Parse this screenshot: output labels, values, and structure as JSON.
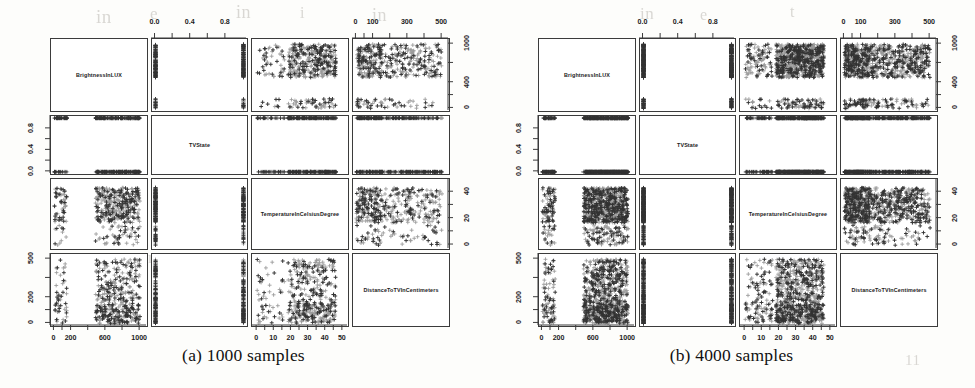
{
  "figure": {
    "type": "scatterplot-matrix-pair",
    "background_color": "#fdfdfb",
    "point_color_dark": "#333333",
    "point_color_light": "#9a9a9a",
    "axis_color": "#3b3b3b"
  },
  "variables": [
    "BrightnessInLUX",
    "TVState",
    "TemperatureInCelsiusDegree",
    "DistanceToTVInCentimeters"
  ],
  "subfigures": [
    {
      "id": "a",
      "caption": "(a) 1000 samples",
      "sample_count": 1000,
      "panel_labels": [
        "BrightnessInLUX",
        "TVState",
        "TemperatureInCelsiusDegree",
        "DistanceToTVInCentimeters"
      ]
    },
    {
      "id": "b",
      "caption": "(b) 4000 samples",
      "sample_count": 4000,
      "panel_labels": [
        "BrightnessInLUX",
        "TVState",
        "TemperatureInCelsiusDegree",
        "DistanceToTVInCentimeters"
      ]
    }
  ],
  "axes": {
    "top_tvstate": {
      "label": "TVState",
      "ticks": [
        "0.0",
        "0.4",
        "0.8"
      ],
      "values": [
        0.0,
        0.4,
        0.8
      ],
      "range": [
        -0.04,
        1.04
      ]
    },
    "top_distance": {
      "label": "DistanceToTVInCentimeters",
      "ticks": [
        "0",
        "100",
        "300",
        "500"
      ],
      "values": [
        0,
        100,
        300,
        500
      ],
      "range": [
        -20,
        540
      ]
    },
    "right_brightness": {
      "label": "BrightnessInLUX",
      "ticks": [
        "0",
        "400",
        "1000"
      ],
      "values": [
        0,
        400,
        1000
      ],
      "range": [
        -40,
        1080
      ]
    },
    "right_temperature": {
      "label": "TemperatureInCelsiusDegree",
      "ticks": [
        "0",
        "20",
        "40"
      ],
      "values": [
        0,
        20,
        40
      ],
      "range": [
        -3,
        50
      ]
    },
    "left_tvstate": {
      "label": "TVState",
      "ticks": [
        "0.0",
        "0.4",
        "0.8"
      ],
      "values": [
        0.0,
        0.4,
        0.8
      ],
      "range": [
        -0.04,
        1.04
      ]
    },
    "left_distance": {
      "label": "DistanceToTVInCentimeters",
      "ticks": [
        "0",
        "200",
        "500"
      ],
      "values": [
        0,
        200,
        500
      ],
      "range": [
        -20,
        540
      ]
    },
    "bottom_brightness": {
      "label": "BrightnessInLUX",
      "ticks": [
        "0",
        "200",
        "600",
        "1000"
      ],
      "values": [
        0,
        200,
        600,
        1000
      ],
      "range": [
        -40,
        1080
      ]
    },
    "bottom_temperature": {
      "label": "TemperatureInCelsiusDegree",
      "ticks": [
        "0",
        "10",
        "20",
        "30",
        "40",
        "50"
      ],
      "values": [
        0,
        10,
        20,
        30,
        40,
        50
      ],
      "range": [
        -3,
        53
      ]
    }
  },
  "chart_data": {
    "type": "scatter",
    "title": "",
    "subtitle": "",
    "layout": "scatterplot matrix (pairs plot), 4x4, two panels",
    "grid": false,
    "legend": "none",
    "marker": "plus",
    "variables": [
      {
        "name": "BrightnessInLUX",
        "axis_range": [
          0,
          1000
        ],
        "ticks": [
          0,
          200,
          400,
          600,
          1000
        ],
        "unit": "LUX"
      },
      {
        "name": "TVState",
        "axis_range": [
          0,
          1
        ],
        "ticks": [
          0.0,
          0.4,
          0.8
        ],
        "unit": "binary"
      },
      {
        "name": "TemperatureInCelsiusDegree",
        "axis_range": [
          0,
          50
        ],
        "ticks": [
          0,
          10,
          20,
          30,
          40,
          50
        ],
        "unit": "degC"
      },
      {
        "name": "DistanceToTVInCentimeters",
        "axis_range": [
          0,
          500
        ],
        "ticks": [
          0,
          100,
          200,
          300,
          500
        ],
        "unit": "cm"
      }
    ],
    "panels": [
      {
        "row": 1,
        "col": 1,
        "kind": "diagonal",
        "label": "BrightnessInLUX"
      },
      {
        "row": 1,
        "col": 2,
        "kind": "scatter",
        "x": "TVState",
        "y": "BrightnessInLUX",
        "pattern": "two vertical bands at x=0 and x=1"
      },
      {
        "row": 1,
        "col": 3,
        "kind": "scatter",
        "x": "TemperatureInCelsiusDegree",
        "y": "BrightnessInLUX",
        "pattern": "dense cloud at y in 500-1000 across all x; sparse band near y=0"
      },
      {
        "row": 1,
        "col": 4,
        "kind": "scatter",
        "x": "DistanceToTVInCentimeters",
        "y": "BrightnessInLUX",
        "pattern": "dense cloud at y in 500-1000 across all x; sparse band near y=0"
      },
      {
        "row": 2,
        "col": 1,
        "kind": "scatter",
        "x": "BrightnessInLUX",
        "y": "TVState",
        "pattern": "points only on y=0 and y=1 rows"
      },
      {
        "row": 2,
        "col": 2,
        "kind": "diagonal",
        "label": "TVState"
      },
      {
        "row": 2,
        "col": 3,
        "kind": "scatter",
        "x": "TemperatureInCelsiusDegree",
        "y": "TVState",
        "pattern": "points only on y=0 and y=1 rows"
      },
      {
        "row": 2,
        "col": 4,
        "kind": "scatter",
        "x": "DistanceToTVInCentimeters",
        "y": "TVState",
        "pattern": "points only on y=0 and y=1 rows"
      },
      {
        "row": 3,
        "col": 1,
        "kind": "scatter",
        "x": "BrightnessInLUX",
        "y": "TemperatureInCelsiusDegree",
        "pattern": "sparse cluster at x<150; dense cloud at x>500"
      },
      {
        "row": 3,
        "col": 2,
        "kind": "scatter",
        "x": "TVState",
        "y": "TemperatureInCelsiusDegree",
        "pattern": "two vertical bands at x=0 and x=1"
      },
      {
        "row": 3,
        "col": 3,
        "kind": "diagonal",
        "label": "TemperatureInCelsiusDegree"
      },
      {
        "row": 3,
        "col": 4,
        "kind": "scatter",
        "x": "DistanceToTVInCentimeters",
        "y": "TemperatureInCelsiusDegree",
        "pattern": "broad cloud, denser at y in 20-45"
      },
      {
        "row": 4,
        "col": 1,
        "kind": "scatter",
        "x": "BrightnessInLUX",
        "y": "DistanceToTVInCentimeters",
        "pattern": "sparse cluster at x<150; dense cloud at x>500"
      },
      {
        "row": 4,
        "col": 2,
        "kind": "scatter",
        "x": "TVState",
        "y": "DistanceToTVInCentimeters",
        "pattern": "two vertical bands at x=0 and x=1"
      },
      {
        "row": 4,
        "col": 3,
        "kind": "scatter",
        "x": "TemperatureInCelsiusDegree",
        "y": "DistanceToTVInCentimeters",
        "pattern": "broad cloud, denser at x in 25-45"
      },
      {
        "row": 4,
        "col": 4,
        "kind": "diagonal",
        "label": "DistanceToTVInCentimeters"
      }
    ]
  },
  "ghost_text": [
    {
      "t": "in",
      "x": 96,
      "y": 6,
      "size": 19
    },
    {
      "t": "e",
      "x": 150,
      "y": 4,
      "size": 17
    },
    {
      "t": "in",
      "x": 236,
      "y": 2,
      "size": 18
    },
    {
      "t": "i",
      "x": 300,
      "y": 4,
      "size": 16
    },
    {
      "t": "in",
      "x": 372,
      "y": 5,
      "size": 18
    },
    {
      "t": "in the",
      "x": 82,
      "y": 52,
      "size": 17
    },
    {
      "t": "a",
      "x": 236,
      "y": 50,
      "size": 16
    },
    {
      "t": "in",
      "x": 640,
      "y": 4,
      "size": 17
    },
    {
      "t": "e",
      "x": 700,
      "y": 6,
      "size": 16
    },
    {
      "t": "t",
      "x": 790,
      "y": 3,
      "size": 16
    },
    {
      "t": "s",
      "x": 100,
      "y": 86,
      "size": 16
    },
    {
      "t": "a",
      "x": 260,
      "y": 88,
      "size": 16
    },
    {
      "t": "sn",
      "x": 60,
      "y": 122,
      "size": 17
    },
    {
      "t": "e",
      "x": 300,
      "y": 120,
      "size": 16
    },
    {
      "t": "an",
      "x": 80,
      "y": 156,
      "size": 17
    },
    {
      "t": "e",
      "x": 320,
      "y": 155,
      "size": 16
    },
    {
      "t": "o",
      "x": 580,
      "y": 124,
      "size": 16
    },
    {
      "t": "b",
      "x": 760,
      "y": 120,
      "size": 16
    },
    {
      "t": "an",
      "x": 140,
      "y": 248,
      "size": 17
    },
    {
      "t": "e",
      "x": 360,
      "y": 250,
      "size": 16
    },
    {
      "t": "11",
      "x": 905,
      "y": 352,
      "size": 15
    },
    {
      "t": "1",
      "x": 860,
      "y": 300,
      "size": 14
    }
  ]
}
